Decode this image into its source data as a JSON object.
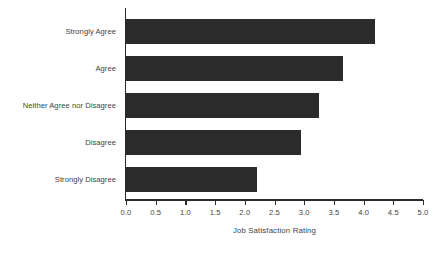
{
  "chart_data": {
    "type": "bar",
    "orientation": "horizontal",
    "title": "",
    "xlabel": "Job Satisfaction Rating",
    "ylabel": "",
    "categories": [
      "Strongly Agree",
      "Agree",
      "Neither Agree nor Disagree",
      "Disagree",
      "Strongly Disagree"
    ],
    "values": [
      4.2,
      3.65,
      3.25,
      2.95,
      2.2
    ],
    "xlim": [
      0.0,
      5.0
    ],
    "xticks": [
      "0.0",
      "0.5",
      "1.0",
      "1.5",
      "2.0",
      "2.5",
      "3.0",
      "3.5",
      "4.0",
      "4.5",
      "5.0"
    ],
    "xtick_values": [
      0.0,
      0.5,
      1.0,
      1.5,
      2.0,
      2.5,
      3.0,
      3.5,
      4.0,
      4.5,
      5.0
    ],
    "grid": false,
    "legend": null,
    "bar_color": "#2b2b2b",
    "axis_color": "#2b2b2b",
    "text_color": "#434343",
    "background": "#ffffff"
  },
  "bottom_caption": "",
  "axis": {
    "x_title": "Job Satisfaction Rating"
  }
}
